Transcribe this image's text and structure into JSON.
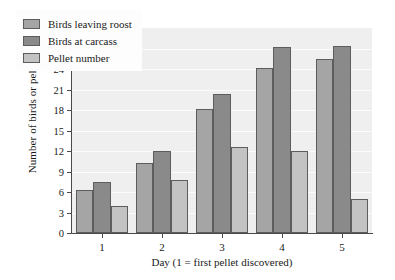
{
  "chart_data": {
    "type": "bar",
    "title": "",
    "xlabel": "Day (1 = first pellet discovered)",
    "ylabel": "Number of birds or pellets",
    "categories": [
      "1",
      "2",
      "3",
      "4",
      "5"
    ],
    "series": [
      {
        "name": "Birds leaving roost",
        "color": "#a5a5a5",
        "values": [
          6.3,
          10.3,
          18.2,
          24.1,
          25.5
        ]
      },
      {
        "name": "Birds at carcass",
        "color": "#8a8a8a",
        "values": [
          7.5,
          12.0,
          20.4,
          27.2,
          27.3
        ]
      },
      {
        "name": "Pellet number",
        "color": "#c3c3c3",
        "values": [
          4.0,
          7.7,
          12.6,
          12.0,
          5.0
        ]
      }
    ],
    "ylim": [
      0,
      30
    ],
    "yticks": [
      0,
      3,
      6,
      9,
      12,
      15,
      18,
      21,
      24,
      27,
      30
    ],
    "grid": true,
    "legend_position": "top-left"
  },
  "colors": {
    "plot_background": "#efefef",
    "axis": "#4a4a4a",
    "gridline": "#fbfbfb",
    "bar_border": "#5d5d5d",
    "text": "#1a1a1a"
  }
}
